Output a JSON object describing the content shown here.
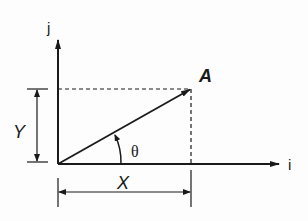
{
  "diagram": {
    "type": "vector-components",
    "axes": {
      "horizontal_label": "i",
      "vertical_label": "j"
    },
    "vector": {
      "label": "A",
      "angle_label": "θ"
    },
    "components": {
      "x_label": "X",
      "y_label": "Y"
    },
    "colors": {
      "line": "#1a1a1a",
      "background": "#fdfdfd"
    }
  }
}
